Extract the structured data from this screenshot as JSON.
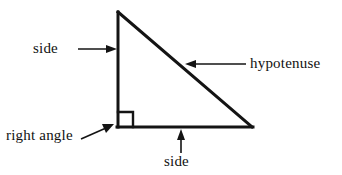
{
  "figure": {
    "type": "geometry-diagram",
    "background_color": "#ffffff",
    "stroke_color": "#141414",
    "triangle": {
      "vertices": {
        "apex": [
          118,
          12
        ],
        "right_angle_corner": [
          118,
          127
        ],
        "bottom_right": [
          252,
          127
        ]
      },
      "edges": [
        {
          "name": "vertical-leg",
          "from": [
            118,
            12
          ],
          "to": [
            118,
            127
          ],
          "label": "side"
        },
        {
          "name": "horizontal-leg",
          "from": [
            118,
            127
          ],
          "to": [
            252,
            127
          ],
          "label": "side"
        },
        {
          "name": "hypotenuse",
          "from": [
            118,
            12
          ],
          "to": [
            252,
            127
          ],
          "label": "hypotenuse"
        }
      ],
      "right_angle_marker": {
        "name": "right-angle-square",
        "corner": [
          118,
          127
        ],
        "size": 14
      }
    },
    "labels": {
      "side_left": "side",
      "hypotenuse": "hypotenuse",
      "right_angle": "right angle",
      "side_bottom": "side"
    },
    "leaders": [
      {
        "name": "side-left-leader",
        "from": [
          78,
          49
        ],
        "to": [
          116,
          49
        ],
        "direction": "right"
      },
      {
        "name": "hypotenuse-leader",
        "from": [
          246,
          64
        ],
        "to": [
          186,
          64
        ],
        "direction": "left"
      },
      {
        "name": "right-angle-leader",
        "from": [
          82,
          138
        ],
        "to": [
          114,
          124
        ],
        "direction": "up-right"
      },
      {
        "name": "side-bottom-leader",
        "from": [
          181,
          153
        ],
        "to": [
          181,
          130
        ],
        "direction": "up"
      }
    ]
  }
}
